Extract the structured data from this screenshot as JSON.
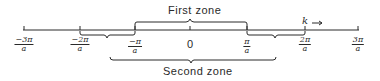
{
  "diagram": {
    "type": "brillouin-zone-number-line",
    "axis_variable": "k",
    "axis_arrow": "→",
    "ticks": [
      {
        "num": "−3π",
        "den": "a",
        "x": 24
      },
      {
        "num": "−2π",
        "den": "a",
        "x": 80
      },
      {
        "num": "−π",
        "den": "a",
        "x": 135
      },
      {
        "num": "0",
        "den": "",
        "x": 190
      },
      {
        "num": "π",
        "den": "a",
        "x": 247
      },
      {
        "num": "2π",
        "den": "a",
        "x": 305
      },
      {
        "num": "3π",
        "den": "a",
        "x": 358
      }
    ],
    "zones": {
      "first": {
        "label": "First zone",
        "from": "−π/a",
        "to": "π/a"
      },
      "second": {
        "label": "Second zone",
        "segments": [
          {
            "from": "−2π/a",
            "to": "−π/a"
          },
          {
            "from": "π/a",
            "to": "2π/a"
          }
        ]
      }
    },
    "colors": {
      "ink": "#2a2a2a",
      "background": "#ffffff"
    }
  }
}
